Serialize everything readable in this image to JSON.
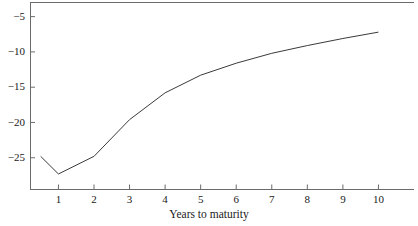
{
  "chart_data": {
    "type": "line",
    "title": "",
    "subtitle": "",
    "xlabel": "Years to maturity",
    "ylabel": "",
    "x": [
      0.5,
      1,
      2,
      3,
      4,
      5,
      6,
      7,
      8,
      9,
      10
    ],
    "values": [
      -24.8,
      -27.3,
      -24.8,
      -19.6,
      -15.8,
      -13.3,
      -11.6,
      -10.2,
      -9.1,
      -8.1,
      -7.2
    ],
    "series": [
      {
        "name": "curve",
        "x": [
          0.5,
          1,
          2,
          3,
          4,
          5,
          6,
          7,
          8,
          9,
          10
        ],
        "values": [
          -24.8,
          -27.3,
          -24.8,
          -19.6,
          -15.8,
          -13.3,
          -11.6,
          -10.2,
          -9.1,
          -8.1,
          -7.2
        ]
      }
    ],
    "xlim": [
      0.2,
      11.0
    ],
    "ylim": [
      -29.5,
      -3.0
    ],
    "xticks": [
      1,
      2,
      3,
      4,
      5,
      6,
      7,
      8,
      9,
      10
    ],
    "xticklabels": [
      "1",
      "2",
      "3",
      "4",
      "5",
      "6",
      "7",
      "8",
      "9",
      "10"
    ],
    "yticks": [
      -5,
      -10,
      -15,
      -20,
      -25
    ],
    "yticklabels": [
      "−5",
      "−10",
      "−15",
      "−20",
      "−25"
    ],
    "grid": false,
    "legend": false,
    "legend_position": "none",
    "line_color": "#3a3a3a",
    "axis_color": "#555555",
    "background_color": "#ffffff",
    "annotations": []
  },
  "axis": {
    "x_title": "Years to maturity"
  },
  "colors": {
    "line": "#3a3a3a",
    "axis": "#666666",
    "text": "#1a1a1a",
    "background": "#ffffff"
  }
}
